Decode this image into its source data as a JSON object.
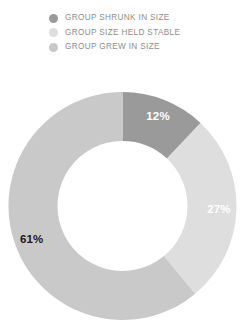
{
  "legend": {
    "items": [
      {
        "label": "GROUP SHRUNK IN SIZE",
        "color": "#9a9a9a",
        "icon": "legend-dot-icon"
      },
      {
        "label": "GROUP SIZE HELD STABLE",
        "color": "#dedede",
        "icon": "legend-dot-icon"
      },
      {
        "label": "GROUP GREW IN SIZE",
        "color": "#c9c9c9",
        "icon": "legend-dot-icon"
      }
    ],
    "text_color": "#8e8e8e"
  },
  "chart_data": {
    "type": "pie",
    "variant": "donut",
    "title": "",
    "subtitle": "",
    "xlabel": "",
    "ylabel": "",
    "legend_position": "top",
    "grid": false,
    "start_angle_deg": 0,
    "direction": "clockwise",
    "center": {
      "x": 122.5,
      "y": 206
    },
    "outer_radius": 114,
    "inner_radius": 65,
    "categories": [
      "GROUP SHRUNK IN SIZE",
      "GROUP SIZE HELD STABLE",
      "GROUP GREW IN SIZE"
    ],
    "values": [
      12,
      27,
      61
    ],
    "value_labels": [
      "12%",
      "27%",
      "61%"
    ],
    "slice_colors": [
      "#9a9a9a",
      "#dedede",
      "#c9c9c9"
    ],
    "label_colors": [
      "#ffffff",
      "#ffffff",
      "#1a1a1a"
    ],
    "units": "percent",
    "total": 100
  }
}
